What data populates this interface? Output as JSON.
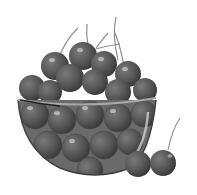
{
  "image": {
    "subject": "Glass bowl of cherries",
    "style": "grayscale clip-art illustration",
    "colors": {
      "background": "#ffffff",
      "cherry_fill": "#5a5a5a",
      "cherry_dark": "#3a3a3a",
      "cherry_highlight": "#bdbdbd",
      "stem": "#8a8a8a",
      "bowl_rim": "#9a9a9a",
      "bowl_glass": "#6e6e6e"
    },
    "elements": [
      "bowl",
      "cherries-in-bowl",
      "cherry-stems",
      "loose-cherry-pair"
    ]
  }
}
